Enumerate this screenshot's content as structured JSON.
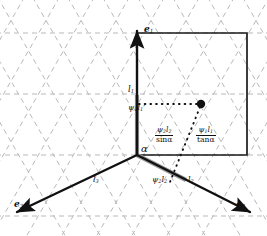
{
  "figure": {
    "type": "geometry-diagram",
    "background_lattice": {
      "style": "dashed",
      "color": "#b9b9bd",
      "angle_deg": 60,
      "description": "triangular lattice"
    },
    "colors": {
      "axis": "#111111",
      "square": "#1a1a1a",
      "lattice": "#b9b9bd",
      "gray_segment": "#9a9a9a",
      "dot": "#111111"
    },
    "axes": [
      {
        "id": "e1",
        "label": "e",
        "sub": "1",
        "direction": "up",
        "tip": [
          137,
          28
        ]
      },
      {
        "id": "e2",
        "label": "e",
        "sub": "2",
        "direction": "lower-right",
        "tip": [
          252,
          213
        ]
      },
      {
        "id": "e3",
        "label": "e",
        "sub": "3",
        "direction": "lower-left",
        "tip": [
          14,
          213
        ]
      }
    ],
    "origin": [
      137,
      155
    ],
    "square": {
      "x": 137,
      "y": 33,
      "width": 110,
      "height": 122
    },
    "point": {
      "x": 201,
      "y": 104,
      "radius": 4.2
    },
    "labels": {
      "e1": "e",
      "e1_sub": "1",
      "e2": "e",
      "e2_sub": "2",
      "e3": "e",
      "e3_sub": "3",
      "alpha": "α",
      "l1": "l",
      "l1_sub": "1",
      "l2": "l",
      "l2_sub": "2",
      "l3": "l",
      "l3_sub": "3",
      "psi1_l1_prime_psi": "ψ",
      "psi1_l1_prime_psisub": "1",
      "psi1_l1_prime_l": "l",
      "psi1_l1_prime_lsub": "1",
      "psi1_l1_prime_mark": "′",
      "psi2_l2_psi": "ψ",
      "psi2_l2_psisub": "2",
      "psi2_l2_l": "l",
      "psi2_l2_lsub": "2",
      "frac_left_num_psi": "ψ",
      "frac_left_num_psisub": "2",
      "frac_left_num_l": "l",
      "frac_left_num_lsub": "2",
      "frac_left_den": "sinα",
      "frac_right_num_psi": "ψ",
      "frac_right_num_psisub": "1",
      "frac_right_num_l": "l",
      "frac_right_num_lsub": "1",
      "frac_right_den": "tanα"
    }
  }
}
